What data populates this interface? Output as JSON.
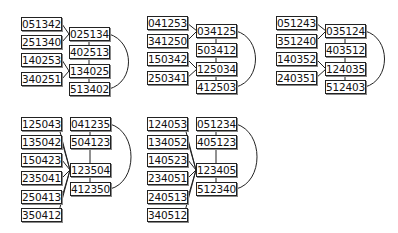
{
  "panels": [
    {
      "id": "p1",
      "left": [
        "051342",
        "251340",
        "140253",
        "340251"
      ],
      "right": [
        "025134",
        "402513",
        "134025",
        "513402"
      ]
    },
    {
      "id": "p2",
      "left": [
        "041253",
        "341250",
        "150342",
        "250341"
      ],
      "right": [
        "034125",
        "503412",
        "125034",
        "412503"
      ]
    },
    {
      "id": "p3",
      "left": [
        "051243",
        "351240",
        "140352",
        "240351"
      ],
      "right": [
        "035124",
        "403512",
        "124035",
        "512403"
      ]
    },
    {
      "id": "p4",
      "left": [
        "125043",
        "135042",
        "150423",
        "235041",
        "250413",
        "350412"
      ],
      "right": [
        "041235",
        "504123",
        "123504",
        "412350"
      ]
    },
    {
      "id": "p5",
      "left": [
        "124053",
        "134052",
        "140523",
        "234051",
        "240513",
        "340512"
      ],
      "right": [
        "051234",
        "405123",
        "123405",
        "512340"
      ]
    }
  ]
}
